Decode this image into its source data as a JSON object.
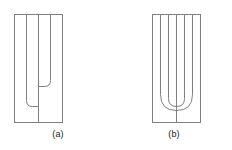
{
  "figure": {
    "background_color": "#ffffff",
    "line_color": "#808080",
    "line_width": 1,
    "caption_color": "#1a1a1a",
    "panels": [
      {
        "id": "a",
        "caption": "(a)",
        "description": "rectangle with four vertical lines and two nested asymmetric staggered U-shaped curves",
        "rect": {
          "x": 14,
          "y": 14,
          "width": 48,
          "height": 108
        },
        "vertical_lines_x": [
          26,
          38,
          50
        ],
        "center_line_x": 38,
        "center_line_top": 14,
        "center_line_bottom": 122,
        "curves": [
          {
            "name": "inner-u-curve",
            "left_x": 38,
            "right_x": 50,
            "bottom_y": 86,
            "top_y": 14,
            "radius": 6
          },
          {
            "name": "outer-u-curve",
            "left_x": 26,
            "right_x": 38,
            "bottom_y": 106,
            "top_y": 14,
            "radius": 6
          }
        ]
      },
      {
        "id": "b",
        "caption": "(b)",
        "description": "rectangle with four vertical lines and two nested symmetric U-shaped curves",
        "rect": {
          "x": 36,
          "y": 14,
          "width": 48,
          "height": 108
        },
        "vertical_lines_x": [
          44,
          60,
          76
        ],
        "center_line_x": 60,
        "center_line_top": 14,
        "center_line_bottom": 122,
        "curves": [
          {
            "name": "inner-u-curve",
            "left_x": 52,
            "right_x": 68,
            "bottom_y": 106,
            "top_y": 14,
            "radius": 8
          },
          {
            "name": "outer-u-curve",
            "left_x": 44,
            "right_x": 76,
            "bottom_y": 110,
            "top_y": 14,
            "radius": 16
          }
        ]
      }
    ]
  }
}
